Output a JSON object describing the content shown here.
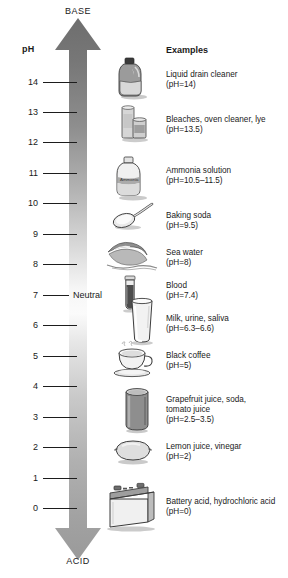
{
  "diagram": {
    "axis_label": "pH",
    "top_end_label": "BASE",
    "bottom_end_label": "ACID",
    "neutral_label": "Neutral",
    "examples_header": "Examples",
    "colors": {
      "arrow_base_dark": "#6f6f6f",
      "arrow_mid_light": "#f2f2f2",
      "arrow_acid_dark": "#8a8a8a",
      "tick": "#1d1d1d",
      "text": "#1a1a1a"
    },
    "scale": {
      "min": 0,
      "max": 14,
      "neutral": 7,
      "ticks": [
        {
          "value": "14",
          "y": 82
        },
        {
          "value": "13",
          "y": 112
        },
        {
          "value": "12",
          "y": 142
        },
        {
          "value": "11",
          "y": 173
        },
        {
          "value": "10",
          "y": 203
        },
        {
          "value": "9",
          "y": 234
        },
        {
          "value": "8",
          "y": 264
        },
        {
          "value": "7",
          "y": 295
        },
        {
          "value": "6",
          "y": 325
        },
        {
          "value": "5",
          "y": 356
        },
        {
          "value": "4",
          "y": 386
        },
        {
          "value": "3",
          "y": 417
        },
        {
          "value": "2",
          "y": 447
        },
        {
          "value": "1",
          "y": 478
        },
        {
          "value": "0",
          "y": 508
        }
      ]
    },
    "examples": [
      {
        "name": "Liquid drain cleaner",
        "ph": "(pH=14)",
        "icon": "jug-bottle-icon",
        "y": 70
      },
      {
        "name": "Bleaches, oven cleaner, lye",
        "ph": "(pH=13.5)",
        "icon": "spray-cans-icon",
        "y": 115
      },
      {
        "name": "Ammonia solution",
        "ph": "(pH=10.5–11.5)",
        "icon": "ammonia-bottle-icon",
        "y": 166
      },
      {
        "name": "Baking soda",
        "ph": "(pH=9.5)",
        "icon": "spoon-icon",
        "y": 211
      },
      {
        "name": "Sea water",
        "ph": "(pH=8)",
        "icon": "wave-icon",
        "y": 248
      },
      {
        "name": "Blood",
        "ph": "(pH=7.4)",
        "icon": "test-tube-icon",
        "y": 281
      },
      {
        "name": "Milk, urine, saliva",
        "ph": "(pH=6.3–6.6)",
        "icon": "glass-icon",
        "y": 314
      },
      {
        "name": "Black coffee",
        "ph": "(pH=5)",
        "icon": "coffee-cup-icon",
        "y": 351
      },
      {
        "name": "Grapefruit juice, soda,",
        "ph": "(pH=2.5–3.5)",
        "icon": "soda-can-icon",
        "y": 395,
        "name2": "tomato juice"
      },
      {
        "name": "Lemon juice, vinegar",
        "ph": "(pH=2)",
        "icon": "lemon-icon",
        "y": 442
      },
      {
        "name": "Battery acid, hydrochloric acid",
        "ph": "(pH=0)",
        "icon": "car-battery-icon",
        "y": 497
      }
    ]
  }
}
